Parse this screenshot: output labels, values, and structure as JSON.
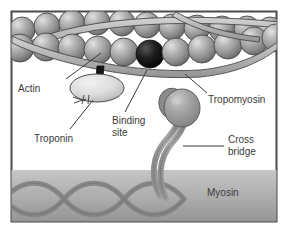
{
  "figure": {
    "background_color": "#ffffff",
    "frame_color": "#4a4a4a",
    "frame": {
      "x": 11,
      "y": 11,
      "width": 266,
      "height": 211
    }
  },
  "labels": {
    "actin": "Actin",
    "troponin": "Troponin",
    "binding_site_line1": "Binding",
    "binding_site_line2": "site",
    "tropomyosin": "Tropomyosin",
    "cross_bridge_line1": "Cross",
    "cross_bridge_line2": "bridge",
    "myosin": "Myosin"
  },
  "colors": {
    "actin_sphere": "#9a9a9a",
    "actin_sphere_highlight": "#d6d6d6",
    "actin_sphere_shadow": "#6e6e6e",
    "binding_site": "#111111",
    "troponin_fill": "#d9d9d9",
    "tropomyosin_ribbon": "#b5b5b5",
    "myosin_head": "#9d9d9d",
    "myosin_band_top": "#bdbdbd",
    "myosin_band_bottom": "#9c9c9c",
    "myosin_strand": "#8c8c8c",
    "leader_line": "#3a3a3a",
    "outline": "#3c3c3c",
    "label_text": "#3a3a3a"
  },
  "structures": {
    "actin_filament": {
      "name": "actin",
      "description": "Double row of globular actin subunits forming the thin filament",
      "back_row_count": 11,
      "front_row_count": 10
    },
    "tropomyosin": {
      "name": "tropomyosin",
      "description": "Two crossing ribbon strands wound along the actin filament",
      "strand_count": 2
    },
    "binding_site": {
      "name": "binding-site",
      "description": "Darkened actin subunit representing the myosin binding site"
    },
    "troponin": {
      "name": "troponin",
      "description": "Ellipsoidal troponin complex attached below the actin filament"
    },
    "myosin": {
      "name": "myosin",
      "description": "Thick filament band with twisted tail strands",
      "cross_bridge": "Myosin head and neck projecting up toward actin"
    }
  },
  "leaders": {
    "actin": {
      "from": [
        66,
        80
      ],
      "to": [
        100,
        53
      ]
    },
    "troponin": {
      "from": [
        70,
        130
      ],
      "to": [
        92,
        104
      ]
    },
    "binding_site": {
      "from": [
        124,
        113
      ],
      "to": [
        146,
        70
      ]
    },
    "tropomyosin": {
      "from": [
        206,
        95
      ],
      "to": [
        183,
        74
      ]
    },
    "cross_bridge": {
      "from": [
        224,
        145
      ],
      "to": [
        184,
        145
      ]
    },
    "myosin": {
      "label_pos": [
        207,
        193
      ]
    }
  }
}
